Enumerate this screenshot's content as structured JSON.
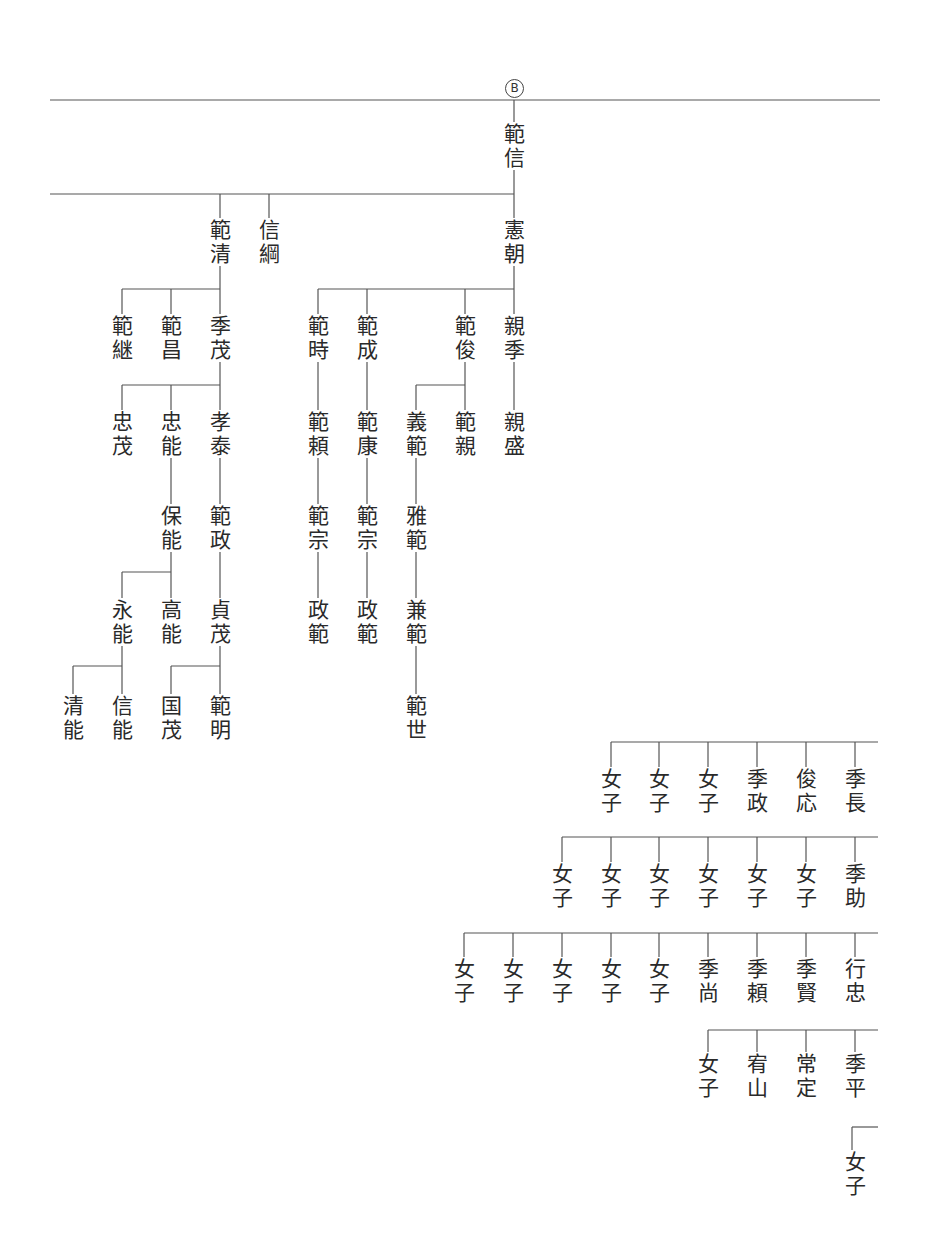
{
  "diagram": {
    "type": "genealogy-tree",
    "orientation": "vertical-text",
    "marker": {
      "label": "B",
      "x": 514,
      "y": 79
    },
    "line_color": "#555555",
    "text_color": "#2a2a2a",
    "nodes": [
      {
        "id": "n1",
        "name": "範信",
        "x": 514,
        "y": 122
      },
      {
        "id": "n2",
        "name": "範清",
        "x": 220,
        "y": 218
      },
      {
        "id": "n3",
        "name": "信綱",
        "x": 269,
        "y": 218
      },
      {
        "id": "n4",
        "name": "憲朝",
        "x": 514,
        "y": 218
      },
      {
        "id": "n5",
        "name": "範継",
        "x": 122,
        "y": 314
      },
      {
        "id": "n6",
        "name": "範昌",
        "x": 171,
        "y": 314
      },
      {
        "id": "n7",
        "name": "季茂",
        "x": 220,
        "y": 314
      },
      {
        "id": "n8",
        "name": "範時",
        "x": 318,
        "y": 314
      },
      {
        "id": "n9",
        "name": "範成",
        "x": 367,
        "y": 314
      },
      {
        "id": "n10",
        "name": "範俊",
        "x": 465,
        "y": 314
      },
      {
        "id": "n11",
        "name": "親季",
        "x": 514,
        "y": 314
      },
      {
        "id": "n12",
        "name": "忠茂",
        "x": 122,
        "y": 410
      },
      {
        "id": "n13",
        "name": "忠能",
        "x": 171,
        "y": 410
      },
      {
        "id": "n14",
        "name": "孝泰",
        "x": 220,
        "y": 410
      },
      {
        "id": "n15",
        "name": "範頼",
        "x": 318,
        "y": 410
      },
      {
        "id": "n16",
        "name": "範康",
        "x": 367,
        "y": 410
      },
      {
        "id": "n17",
        "name": "義範",
        "x": 416,
        "y": 410
      },
      {
        "id": "n18",
        "name": "範親",
        "x": 465,
        "y": 410
      },
      {
        "id": "n19",
        "name": "親盛",
        "x": 514,
        "y": 410
      },
      {
        "id": "n20",
        "name": "保能",
        "x": 171,
        "y": 504
      },
      {
        "id": "n21",
        "name": "範政",
        "x": 220,
        "y": 504
      },
      {
        "id": "n22",
        "name": "範宗",
        "x": 318,
        "y": 504
      },
      {
        "id": "n23",
        "name": "範宗",
        "x": 367,
        "y": 504
      },
      {
        "id": "n24",
        "name": "雅範",
        "x": 416,
        "y": 504
      },
      {
        "id": "n25",
        "name": "永能",
        "x": 122,
        "y": 598
      },
      {
        "id": "n26",
        "name": "高能",
        "x": 171,
        "y": 598
      },
      {
        "id": "n27",
        "name": "貞茂",
        "x": 220,
        "y": 598
      },
      {
        "id": "n28",
        "name": "政範",
        "x": 318,
        "y": 598
      },
      {
        "id": "n29",
        "name": "政範",
        "x": 367,
        "y": 598
      },
      {
        "id": "n30",
        "name": "兼範",
        "x": 416,
        "y": 598
      },
      {
        "id": "n31",
        "name": "清能",
        "x": 73,
        "y": 694
      },
      {
        "id": "n32",
        "name": "信能",
        "x": 122,
        "y": 694
      },
      {
        "id": "n33",
        "name": "国茂",
        "x": 171,
        "y": 694
      },
      {
        "id": "n34",
        "name": "範明",
        "x": 220,
        "y": 694
      },
      {
        "id": "n35",
        "name": "範世",
        "x": 416,
        "y": 694
      },
      {
        "id": "r1a",
        "name": "女子",
        "x": 611,
        "y": 767
      },
      {
        "id": "r1b",
        "name": "女子",
        "x": 659,
        "y": 767
      },
      {
        "id": "r1c",
        "name": "女子",
        "x": 708,
        "y": 767
      },
      {
        "id": "r1d",
        "name": "季政",
        "x": 757,
        "y": 767
      },
      {
        "id": "r1e",
        "name": "俊応",
        "x": 806,
        "y": 767
      },
      {
        "id": "r1f",
        "name": "季長",
        "x": 855,
        "y": 767
      },
      {
        "id": "r2a",
        "name": "女子",
        "x": 562,
        "y": 862
      },
      {
        "id": "r2b",
        "name": "女子",
        "x": 611,
        "y": 862
      },
      {
        "id": "r2c",
        "name": "女子",
        "x": 659,
        "y": 862
      },
      {
        "id": "r2d",
        "name": "女子",
        "x": 708,
        "y": 862
      },
      {
        "id": "r2e",
        "name": "女子",
        "x": 757,
        "y": 862
      },
      {
        "id": "r2f",
        "name": "女子",
        "x": 806,
        "y": 862
      },
      {
        "id": "r2g",
        "name": "季助",
        "x": 855,
        "y": 862
      },
      {
        "id": "r3a",
        "name": "女子",
        "x": 464,
        "y": 957
      },
      {
        "id": "r3b",
        "name": "女子",
        "x": 513,
        "y": 957
      },
      {
        "id": "r3c",
        "name": "女子",
        "x": 562,
        "y": 957
      },
      {
        "id": "r3d",
        "name": "女子",
        "x": 611,
        "y": 957
      },
      {
        "id": "r3e",
        "name": "女子",
        "x": 659,
        "y": 957
      },
      {
        "id": "r3f",
        "name": "季尚",
        "x": 708,
        "y": 957
      },
      {
        "id": "r3g",
        "name": "季頼",
        "x": 757,
        "y": 957
      },
      {
        "id": "r3h",
        "name": "季賢",
        "x": 806,
        "y": 957
      },
      {
        "id": "r3i",
        "name": "行忠",
        "x": 855,
        "y": 957
      },
      {
        "id": "r4a",
        "name": "女子",
        "x": 708,
        "y": 1052
      },
      {
        "id": "r4b",
        "name": "宥山",
        "x": 757,
        "y": 1052
      },
      {
        "id": "r4c",
        "name": "常定",
        "x": 806,
        "y": 1052
      },
      {
        "id": "r4d",
        "name": "季平",
        "x": 855,
        "y": 1052
      },
      {
        "id": "r5a",
        "name": "女子",
        "x": 855,
        "y": 1150
      }
    ],
    "lines": [
      {
        "x1": 50,
        "y1": 100,
        "x2": 880,
        "y2": 100
      },
      {
        "x1": 514,
        "y1": 100,
        "x2": 514,
        "y2": 122
      },
      {
        "x1": 514,
        "y1": 170,
        "x2": 514,
        "y2": 218
      },
      {
        "x1": 50,
        "y1": 194,
        "x2": 514,
        "y2": 194
      },
      {
        "x1": 220,
        "y1": 194,
        "x2": 220,
        "y2": 218
      },
      {
        "x1": 269,
        "y1": 194,
        "x2": 269,
        "y2": 218
      },
      {
        "x1": 220,
        "y1": 266,
        "x2": 220,
        "y2": 314
      },
      {
        "x1": 122,
        "y1": 289,
        "x2": 220,
        "y2": 289
      },
      {
        "x1": 122,
        "y1": 289,
        "x2": 122,
        "y2": 314
      },
      {
        "x1": 171,
        "y1": 289,
        "x2": 171,
        "y2": 314
      },
      {
        "x1": 514,
        "y1": 266,
        "x2": 514,
        "y2": 314
      },
      {
        "x1": 318,
        "y1": 289,
        "x2": 514,
        "y2": 289
      },
      {
        "x1": 318,
        "y1": 289,
        "x2": 318,
        "y2": 314
      },
      {
        "x1": 367,
        "y1": 289,
        "x2": 367,
        "y2": 314
      },
      {
        "x1": 465,
        "y1": 289,
        "x2": 465,
        "y2": 314
      },
      {
        "x1": 220,
        "y1": 362,
        "x2": 220,
        "y2": 410
      },
      {
        "x1": 122,
        "y1": 385,
        "x2": 220,
        "y2": 385
      },
      {
        "x1": 122,
        "y1": 385,
        "x2": 122,
        "y2": 410
      },
      {
        "x1": 171,
        "y1": 385,
        "x2": 171,
        "y2": 410
      },
      {
        "x1": 318,
        "y1": 362,
        "x2": 318,
        "y2": 410
      },
      {
        "x1": 367,
        "y1": 362,
        "x2": 367,
        "y2": 410
      },
      {
        "x1": 465,
        "y1": 362,
        "x2": 465,
        "y2": 410
      },
      {
        "x1": 416,
        "y1": 385,
        "x2": 465,
        "y2": 385
      },
      {
        "x1": 416,
        "y1": 385,
        "x2": 416,
        "y2": 410
      },
      {
        "x1": 514,
        "y1": 362,
        "x2": 514,
        "y2": 410
      },
      {
        "x1": 171,
        "y1": 458,
        "x2": 171,
        "y2": 504
      },
      {
        "x1": 220,
        "y1": 458,
        "x2": 220,
        "y2": 504
      },
      {
        "x1": 318,
        "y1": 458,
        "x2": 318,
        "y2": 504
      },
      {
        "x1": 367,
        "y1": 458,
        "x2": 367,
        "y2": 504
      },
      {
        "x1": 416,
        "y1": 458,
        "x2": 416,
        "y2": 504
      },
      {
        "x1": 171,
        "y1": 552,
        "x2": 171,
        "y2": 598
      },
      {
        "x1": 122,
        "y1": 572,
        "x2": 171,
        "y2": 572
      },
      {
        "x1": 122,
        "y1": 572,
        "x2": 122,
        "y2": 598
      },
      {
        "x1": 220,
        "y1": 552,
        "x2": 220,
        "y2": 598
      },
      {
        "x1": 318,
        "y1": 552,
        "x2": 318,
        "y2": 598
      },
      {
        "x1": 367,
        "y1": 552,
        "x2": 367,
        "y2": 598
      },
      {
        "x1": 416,
        "y1": 552,
        "x2": 416,
        "y2": 598
      },
      {
        "x1": 122,
        "y1": 646,
        "x2": 122,
        "y2": 694
      },
      {
        "x1": 73,
        "y1": 666,
        "x2": 122,
        "y2": 666
      },
      {
        "x1": 73,
        "y1": 666,
        "x2": 73,
        "y2": 694
      },
      {
        "x1": 220,
        "y1": 646,
        "x2": 220,
        "y2": 694
      },
      {
        "x1": 171,
        "y1": 666,
        "x2": 220,
        "y2": 666
      },
      {
        "x1": 171,
        "y1": 666,
        "x2": 171,
        "y2": 694
      },
      {
        "x1": 416,
        "y1": 646,
        "x2": 416,
        "y2": 694
      },
      {
        "x1": 611,
        "y1": 742,
        "x2": 878,
        "y2": 742
      },
      {
        "x1": 611,
        "y1": 742,
        "x2": 611,
        "y2": 767
      },
      {
        "x1": 659,
        "y1": 742,
        "x2": 659,
        "y2": 767
      },
      {
        "x1": 708,
        "y1": 742,
        "x2": 708,
        "y2": 767
      },
      {
        "x1": 757,
        "y1": 742,
        "x2": 757,
        "y2": 767
      },
      {
        "x1": 806,
        "y1": 742,
        "x2": 806,
        "y2": 767
      },
      {
        "x1": 855,
        "y1": 742,
        "x2": 855,
        "y2": 767
      },
      {
        "x1": 562,
        "y1": 837,
        "x2": 878,
        "y2": 837
      },
      {
        "x1": 562,
        "y1": 837,
        "x2": 562,
        "y2": 862
      },
      {
        "x1": 611,
        "y1": 837,
        "x2": 611,
        "y2": 862
      },
      {
        "x1": 659,
        "y1": 837,
        "x2": 659,
        "y2": 862
      },
      {
        "x1": 708,
        "y1": 837,
        "x2": 708,
        "y2": 862
      },
      {
        "x1": 757,
        "y1": 837,
        "x2": 757,
        "y2": 862
      },
      {
        "x1": 806,
        "y1": 837,
        "x2": 806,
        "y2": 862
      },
      {
        "x1": 855,
        "y1": 837,
        "x2": 855,
        "y2": 862
      },
      {
        "x1": 464,
        "y1": 933,
        "x2": 878,
        "y2": 933
      },
      {
        "x1": 464,
        "y1": 933,
        "x2": 464,
        "y2": 957
      },
      {
        "x1": 513,
        "y1": 933,
        "x2": 513,
        "y2": 957
      },
      {
        "x1": 562,
        "y1": 933,
        "x2": 562,
        "y2": 957
      },
      {
        "x1": 611,
        "y1": 933,
        "x2": 611,
        "y2": 957
      },
      {
        "x1": 659,
        "y1": 933,
        "x2": 659,
        "y2": 957
      },
      {
        "x1": 708,
        "y1": 933,
        "x2": 708,
        "y2": 957
      },
      {
        "x1": 757,
        "y1": 933,
        "x2": 757,
        "y2": 957
      },
      {
        "x1": 806,
        "y1": 933,
        "x2": 806,
        "y2": 957
      },
      {
        "x1": 855,
        "y1": 933,
        "x2": 855,
        "y2": 957
      },
      {
        "x1": 708,
        "y1": 1030,
        "x2": 878,
        "y2": 1030
      },
      {
        "x1": 708,
        "y1": 1030,
        "x2": 708,
        "y2": 1052
      },
      {
        "x1": 757,
        "y1": 1030,
        "x2": 757,
        "y2": 1052
      },
      {
        "x1": 806,
        "y1": 1030,
        "x2": 806,
        "y2": 1052
      },
      {
        "x1": 855,
        "y1": 1030,
        "x2": 855,
        "y2": 1052
      },
      {
        "x1": 852,
        "y1": 1127,
        "x2": 878,
        "y2": 1127
      },
      {
        "x1": 852,
        "y1": 1127,
        "x2": 852,
        "y2": 1150
      }
    ]
  }
}
